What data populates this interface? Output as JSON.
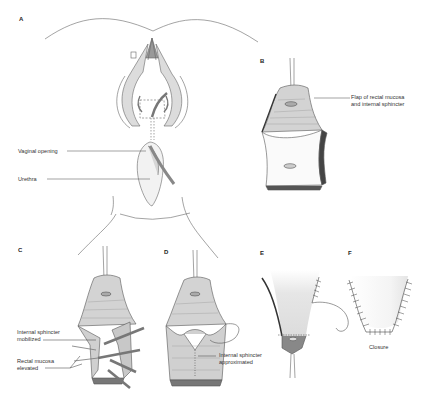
{
  "figure": {
    "panels": [
      {
        "letter": "A",
        "labels": [
          "Vaginal opening",
          "Urethra"
        ]
      },
      {
        "letter": "B",
        "labels": [
          "Flap of rectal mucosa",
          "and internal sphincter"
        ]
      },
      {
        "letter": "C",
        "labels": [
          "Internal sphincter",
          "mobilized",
          "Rectal mucosa",
          "elevated"
        ]
      },
      {
        "letter": "D",
        "labels": [
          "Internal sphincter",
          "approximated"
        ]
      },
      {
        "letter": "E",
        "labels": []
      },
      {
        "letter": "F",
        "labels": [
          "Closure"
        ]
      }
    ]
  },
  "colors": {
    "line": "#555555",
    "tissue": "#d9d9d9",
    "tissue_dark": "#8a8a8a",
    "background": "#ffffff"
  }
}
